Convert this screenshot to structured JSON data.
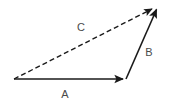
{
  "figure": {
    "type": "vector-addition-triangle",
    "background_color": "#ffffff",
    "stroke_color": "#1a1a1a",
    "label_color": "#4a4a4a",
    "width": 172,
    "height": 104
  },
  "vectors": [
    {
      "id": "A",
      "label": "A",
      "style": "solid",
      "label_x": 65,
      "label_y": 94,
      "start": {
        "x": 14,
        "y": 79
      },
      "end": {
        "x": 126,
        "y": 79
      },
      "arrowhead": "end",
      "stroke_width": 1.6
    },
    {
      "id": "B",
      "label": "B",
      "style": "solid",
      "label_x": 149,
      "label_y": 52,
      "start": {
        "x": 126,
        "y": 79
      },
      "end": {
        "x": 158,
        "y": 6
      },
      "arrowhead": "end",
      "stroke_width": 1.6
    },
    {
      "id": "C",
      "label": "C",
      "style": "dashed",
      "label_x": 81,
      "label_y": 27,
      "start": {
        "x": 14,
        "y": 79
      },
      "end": {
        "x": 158,
        "y": 6
      },
      "arrowhead": "end",
      "stroke_width": 1.4,
      "dash_pattern": "5,3"
    }
  ]
}
